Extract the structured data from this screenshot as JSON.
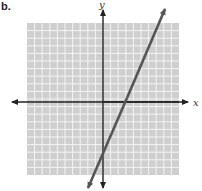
{
  "figure": {
    "label": "b.",
    "x_axis_label": "x",
    "y_axis_label": "y"
  },
  "colors": {
    "grid_fill": "#cfcfcf",
    "grid_lines": "#f2f2f2",
    "axes": "#222222",
    "line": "#555555"
  },
  "chart_data": {
    "type": "line",
    "title": "",
    "xlabel": "x",
    "ylabel": "y",
    "xlim": [
      -10,
      10
    ],
    "ylim": [
      -10,
      10
    ],
    "grid": true,
    "series": [
      {
        "name": "line",
        "x": [
          -2,
          8.2
        ],
        "y": [
          -11.3,
          12.4
        ],
        "approx_equation": "y ≈ 2.3x − 5.6",
        "arrows_both_ends": true
      }
    ]
  }
}
